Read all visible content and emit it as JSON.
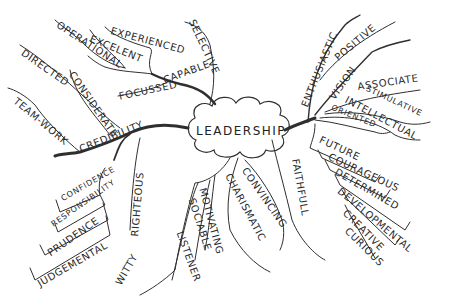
{
  "title": "LEADERSHIP",
  "branches": {
    "top_left": {
      "main": "CAPABLE",
      "items": [
        "SELECTIVE",
        "EXPERIENCED",
        "EXCELENT",
        "OPERATIONAL",
        "FOCUSSED"
      ]
    },
    "left": {
      "main": "CREDIBILITY",
      "items": [
        "CONSIDERATE",
        "DIRECTED",
        "TEAM-WORK"
      ]
    },
    "bottom_left": {
      "items": [
        "CONFIDENCE",
        "RESPONSIBILITY",
        "PRUDENCE",
        "JUDGEMENTAL"
      ]
    },
    "bottom": {
      "items": [
        "RIGHTEOUS",
        "WITTY",
        "LISTENER",
        "SOCIABLE",
        "MOTIVATING",
        "CHARISMATIC",
        "CONVINCING",
        "FAITHFULL"
      ]
    },
    "right": {
      "items": [
        "ENTHUSIASTIC",
        "POSITIVE",
        "VISION",
        "ASSOCIATE",
        "STIMULATIVE",
        "INTELLECTUAL",
        "ORIENTED"
      ]
    },
    "bottom_right": {
      "items": [
        "FUTURE",
        "COURAGEOUS",
        "DETERMINED",
        "DEVELOPMENTAL",
        "CREATIVE",
        "CURIOUS"
      ]
    }
  },
  "colors": {
    "ink": "#2a2a2a",
    "background": "#ffffff"
  }
}
